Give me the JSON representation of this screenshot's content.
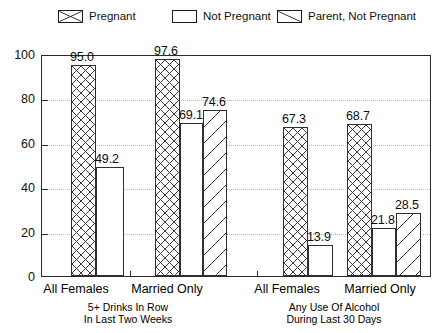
{
  "legend": {
    "items": [
      {
        "label": "Pregnant",
        "pattern": "crosshatch",
        "icon": "crosshatch-swatch-icon"
      },
      {
        "label": "Not Pregnant",
        "pattern": "solid",
        "icon": "blank-swatch-icon"
      },
      {
        "label": "Parent, Not Pregnant",
        "pattern": "diagonal",
        "icon": "diagonal-swatch-icon"
      }
    ]
  },
  "axis": {
    "y_ticks": [
      "0",
      "20",
      "40",
      "60",
      "80",
      "100"
    ],
    "y_min": 0,
    "y_max": 100
  },
  "panels": [
    {
      "caption_line1": "5+ Drinks In Row",
      "caption_line2": "In Last Two Weeks",
      "groups": [
        "All Females",
        "Married Only"
      ]
    },
    {
      "caption_line1": "Any Use Of Alcohol",
      "caption_line2": "During Last 30 Days",
      "groups": [
        "All Females",
        "Married Only"
      ]
    }
  ],
  "chart_data": {
    "type": "bar",
    "title": "",
    "xlabel": "",
    "ylabel": "",
    "ylim": [
      0,
      100
    ],
    "grid": true,
    "legend_position": "top",
    "categories": [
      "5+ Drinks In Row In Last Two Weeks - All Females",
      "5+ Drinks In Row In Last Two Weeks - Married Only",
      "Any Use Of Alcohol During Last 30 Days - All Females",
      "Any Use Of Alcohol During Last 30 Days - Married Only"
    ],
    "series": [
      {
        "name": "Pregnant",
        "values": [
          95.0,
          97.6,
          67.3,
          68.7
        ]
      },
      {
        "name": "Not Pregnant",
        "values": [
          49.2,
          69.1,
          13.9,
          21.8
        ]
      },
      {
        "name": "Parent, Not Pregnant",
        "values": [
          null,
          74.6,
          null,
          28.5
        ]
      }
    ],
    "bars": [
      {
        "value": 95.0,
        "label": "95.0",
        "series": "Pregnant",
        "pattern": "crosshatch"
      },
      {
        "value": 49.2,
        "label": "49.2",
        "series": "Not Pregnant",
        "pattern": "solid"
      },
      {
        "value": 97.6,
        "label": "97.6",
        "series": "Pregnant",
        "pattern": "crosshatch"
      },
      {
        "value": 69.1,
        "label": "69.1",
        "series": "Not Pregnant",
        "pattern": "solid"
      },
      {
        "value": 74.6,
        "label": "74.6",
        "series": "Parent, Not Pregnant",
        "pattern": "diagonal"
      },
      {
        "value": 67.3,
        "label": "67.3",
        "series": "Pregnant",
        "pattern": "crosshatch"
      },
      {
        "value": 13.9,
        "label": "13.9",
        "series": "Not Pregnant",
        "pattern": "solid"
      },
      {
        "value": 68.7,
        "label": "68.7",
        "series": "Pregnant",
        "pattern": "crosshatch"
      },
      {
        "value": 21.8,
        "label": "21.8",
        "series": "Not Pregnant",
        "pattern": "solid"
      },
      {
        "value": 28.5,
        "label": "28.5",
        "series": "Parent, Not Pregnant",
        "pattern": "diagonal"
      }
    ]
  }
}
